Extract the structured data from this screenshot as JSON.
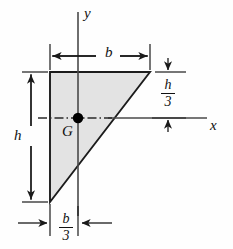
{
  "figure": {
    "shape": {
      "name": "right-triangle",
      "fill_color": "#e2e2e2",
      "stroke_color": "#1a1a1a",
      "vertices": [
        {
          "name": "top-left",
          "x": 50,
          "y": 72
        },
        {
          "name": "top-right",
          "x": 150,
          "y": 72
        },
        {
          "name": "bottom-left",
          "x": 50,
          "y": 202
        }
      ]
    },
    "axes": {
      "x_label": "x",
      "y_label": "y",
      "x_axis_y": 118,
      "y_axis_x": 78,
      "color": "#3d3d3d"
    },
    "centroid": {
      "label": "G",
      "x": 78,
      "y": 118,
      "dot_color": "#000000",
      "dot_radius": 5
    },
    "dimensions": [
      {
        "name": "width",
        "label": "b",
        "orientation": "horizontal",
        "position": "top"
      },
      {
        "name": "height",
        "label": "h",
        "orientation": "vertical",
        "position": "left"
      },
      {
        "name": "centroid-height",
        "numerator": "h",
        "denominator": "3",
        "orientation": "vertical",
        "position": "right"
      },
      {
        "name": "centroid-width",
        "numerator": "b",
        "denominator": "3",
        "orientation": "horizontal",
        "position": "bottom"
      }
    ]
  }
}
